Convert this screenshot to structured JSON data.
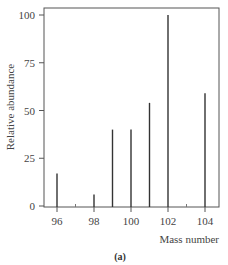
{
  "chart_data": {
    "type": "bar",
    "title": "",
    "caption": "(a)",
    "xlabel": "Mass number",
    "ylabel": "Relative abundance",
    "x_ticks": [
      96,
      98,
      100,
      102,
      104
    ],
    "y_ticks": [
      0,
      25,
      50,
      75,
      100
    ],
    "xlim": [
      95.3,
      104.7
    ],
    "ylim": [
      0,
      104
    ],
    "grid": false,
    "legend": null,
    "categories": [
      96,
      98,
      99,
      100,
      101,
      102,
      104
    ],
    "values": [
      17,
      6,
      40,
      40,
      54,
      100,
      59
    ]
  }
}
